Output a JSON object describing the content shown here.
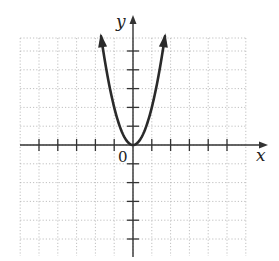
{
  "chart_data": {
    "type": "line",
    "title": "",
    "xlabel": "x",
    "ylabel": "y",
    "origin_label": "0",
    "xlim": [
      -6,
      6
    ],
    "ylim": [
      -6,
      6
    ],
    "grid": true,
    "grid_style": "dotted",
    "x_ticks": [
      -5,
      -4,
      -3,
      -2,
      -1,
      1,
      2,
      3,
      4,
      5
    ],
    "y_ticks": [
      -5,
      -4,
      -3,
      -2,
      -1,
      1,
      2,
      3,
      4,
      5
    ],
    "tick_labels_shown": false,
    "series": [
      {
        "name": "y = 2x^2",
        "equation": "y = 2x^2",
        "x": [
          -1.7,
          -1.5,
          -1.25,
          -1,
          -0.75,
          -0.5,
          -0.25,
          0,
          0.25,
          0.5,
          0.75,
          1,
          1.25,
          1.5,
          1.7
        ],
        "y": [
          5.78,
          4.5,
          3.125,
          2,
          1.125,
          0.5,
          0.125,
          0,
          0.125,
          0.5,
          1.125,
          2,
          3.125,
          4.5,
          5.78
        ],
        "arrows_at_ends": true,
        "color": "#2a2a2a"
      }
    ],
    "legend": "none"
  },
  "colors": {
    "axis": "#333333",
    "grid": "#b0b0b0",
    "curve": "#2a2a2a"
  }
}
